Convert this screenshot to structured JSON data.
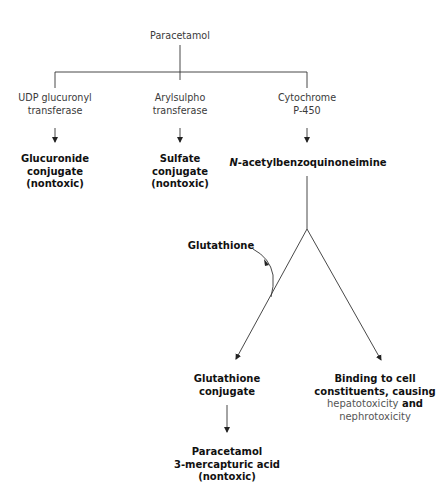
{
  "diagram": {
    "root": {
      "label": "Paracetamol"
    },
    "enzymes": [
      {
        "lines": [
          "UDP glucuronyl",
          "transferase"
        ]
      },
      {
        "lines": [
          "Arylsulpho",
          "transferase"
        ]
      },
      {
        "lines": [
          "Cytochrome",
          "P-450"
        ]
      }
    ],
    "products": [
      {
        "lines": [
          "Glucuronide",
          "conjugate",
          "(nontoxic)"
        ]
      },
      {
        "lines": [
          "Sulfate",
          "conjugate",
          "(nontoxic)"
        ]
      }
    ],
    "napqi": {
      "prefix": "N",
      "rest": "-acetylbenzoquinoneimine"
    },
    "glutathione": {
      "label": "Glutathione"
    },
    "glutathione_conjugate": {
      "lines": [
        "Glutathione",
        "conjugate"
      ]
    },
    "binding": {
      "line1": "Binding to cell",
      "line2": "constituents, causing",
      "line3_a": "hepatotoxicity",
      "line3_b": " and",
      "line4": "nephrotoxicity"
    },
    "mercapturic": {
      "lines": [
        "Paracetamol",
        "3-mercapturic acid",
        "(nontoxic)"
      ]
    },
    "colors": {
      "line": "#222222",
      "text": "#3a3a3a",
      "bold_text": "#111111",
      "gray_text": "#555555"
    }
  }
}
